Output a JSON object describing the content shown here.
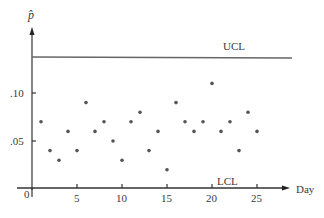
{
  "chart_data": {
    "type": "scatter",
    "title": "",
    "xlabel": "Day",
    "ylabel": "p̂",
    "xlim": [
      0,
      27
    ],
    "ylim": [
      0,
      0.14
    ],
    "x_ticks": [
      0,
      5,
      10,
      15,
      20,
      25
    ],
    "x_tick_labels": [
      "0",
      "5",
      "10",
      "15",
      "20",
      "25"
    ],
    "y_ticks": [
      0.05,
      0.1
    ],
    "y_tick_labels": [
      ".05",
      ".10"
    ],
    "grid": false,
    "legend": null,
    "control_limits": {
      "UCL": {
        "label": "UCL",
        "value": 0.139
      },
      "LCL": {
        "label": "LCL",
        "value": 0
      }
    },
    "series": [
      {
        "name": "p̂",
        "x": [
          1,
          2,
          3,
          4,
          5,
          6,
          7,
          8,
          9,
          10,
          11,
          12,
          13,
          14,
          15,
          16,
          17,
          18,
          19,
          20,
          21,
          22,
          23,
          24,
          25
        ],
        "values": [
          0.07,
          0.04,
          0.03,
          0.06,
          0.04,
          0.09,
          0.06,
          0.07,
          0.05,
          0.03,
          0.07,
          0.08,
          0.04,
          0.06,
          0.02,
          0.09,
          0.07,
          0.06,
          0.07,
          0.11,
          0.06,
          0.07,
          0.04,
          0.08,
          0.06
        ]
      }
    ]
  },
  "labels": {
    "y_axis": "p̂",
    "x_axis": "Day",
    "ucl": "UCL",
    "lcl": "LCL",
    "y_tick_10": ".10",
    "y_tick_05": ".05",
    "x_tick_0": "0",
    "x_tick_5": "5",
    "x_tick_10": "10",
    "x_tick_15": "15",
    "x_tick_20": "20",
    "x_tick_25": "25"
  },
  "colors": {
    "axis": "#333333",
    "control_line": "#666666",
    "points": "#555555"
  }
}
